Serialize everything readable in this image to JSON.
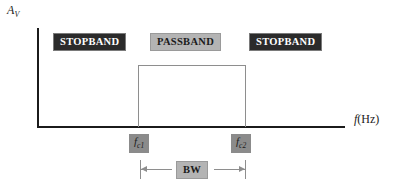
{
  "chart_data": {
    "type": "area",
    "title": "",
    "xlabel": "f (Hz)",
    "ylabel": "A_V",
    "regions": [
      {
        "name": "STOPBAND",
        "from": null,
        "to": "f_c1",
        "gain": 0
      },
      {
        "name": "PASSBAND",
        "from": "f_c1",
        "to": "f_c2",
        "gain": 1
      },
      {
        "name": "STOPBAND",
        "from": "f_c2",
        "to": null,
        "gain": 0
      }
    ],
    "markers": [
      "f_c1",
      "f_c2"
    ],
    "annotations": [
      "BW"
    ],
    "grid": false,
    "legend": false
  },
  "axes": {
    "y_label_letter": "A",
    "y_label_subscript": "V",
    "x_label_letter": "f",
    "x_label_unit": "(Hz)"
  },
  "bands": {
    "stopband_left": "STOPBAND",
    "passband": "PASSBAND",
    "stopband_right": "STOPBAND"
  },
  "cutoffs": {
    "fc1_letter": "f",
    "fc1_subscript": "c1",
    "fc2_letter": "f",
    "fc2_subscript": "c2"
  },
  "bandwidth": {
    "label": "BW"
  },
  "colors": {
    "axis": "#1b1b1b",
    "stopband_bg": "#2b2b2b",
    "stopband_fg": "#ffffff",
    "passband_bg": "#b4b4b4",
    "passband_fg": "#1b1b1b",
    "fc_bg": "#8b8b8b",
    "rect_border": "#8e8e8e",
    "page_bg": "#ffffff"
  }
}
